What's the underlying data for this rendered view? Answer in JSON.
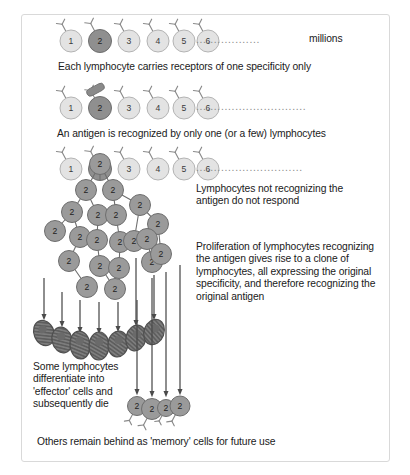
{
  "figure": {
    "background": "#ffffff",
    "frame_color": "#d9d9d9"
  },
  "colors": {
    "naive_cell_fill": "#e3e3e3",
    "naive_cell_stroke": "#b4b4b4",
    "selected_cell_fill": "#8f8f8f",
    "selected_cell_stroke": "#6e6e6e",
    "clone_cell_fill": "#9a9a9a",
    "clone_cell_stroke": "#6e6e6e",
    "effector_cell_fill": "#7d7d7d",
    "effector_cell_stroke": "#4f4f4f",
    "antigen_fill": "#8a8a8a",
    "arrow_color": "#4a4a4a",
    "receptor_color": "#8a8a8a",
    "text_color": "#1a1a1a",
    "dots_color": "#8a8a8a"
  },
  "rows": {
    "row1": {
      "name": "repertoire-row",
      "cell_labels": [
        "1",
        "2",
        "3",
        "4",
        "5",
        "6"
      ],
      "selected_index": 1,
      "dots": "..................",
      "trailing_label": "millions",
      "caption": "Each lymphocyte carries receptors of one specificity only"
    },
    "row2": {
      "name": "antigen-recognition-row",
      "cell_labels": [
        "1",
        "2",
        "3",
        "4",
        "5",
        "6"
      ],
      "selected_index": 1,
      "dots": "...............................",
      "antigen_name": "antigen",
      "caption": "An antigen is recognized by only one (or a few) lymphocytes"
    },
    "row3": {
      "name": "non-responding-row",
      "cell_labels": [
        "1",
        "2",
        "3",
        "4",
        "5",
        "6"
      ],
      "selected_index": 1,
      "dots": "..............................",
      "caption": "Lymphocytes not recognizing the\nantigen do not respond"
    }
  },
  "annotations": {
    "proliferation": "Proliferation of lymphocytes recognizing\nthe antigen gives rise to a clone of\nlymphocytes, all expressing the original\nspecificity, and therefore recognizing the\noriginal antigen",
    "effector": "Some lymphocytes\ndifferentiate into\n'effector' cells and\nsubsequently die",
    "memory": "Others remain behind as 'memory' cells for future use"
  },
  "clone": {
    "name": "proliferating-clone",
    "label": "2",
    "cells": [
      {
        "x": 100,
        "y": 164,
        "r": 10.5
      },
      {
        "x": 86,
        "y": 190,
        "r": 10.5
      },
      {
        "x": 113,
        "y": 190,
        "r": 10.5
      },
      {
        "x": 72,
        "y": 212,
        "r": 10.5
      },
      {
        "x": 98,
        "y": 215,
        "r": 10.5
      },
      {
        "x": 116,
        "y": 215,
        "r": 10.5
      },
      {
        "x": 140,
        "y": 205,
        "r": 10.5
      },
      {
        "x": 158,
        "y": 224,
        "r": 10.5
      },
      {
        "x": 55,
        "y": 231,
        "r": 10.5
      },
      {
        "x": 80,
        "y": 237,
        "r": 10.5
      },
      {
        "x": 97,
        "y": 240,
        "r": 10.5
      },
      {
        "x": 120,
        "y": 242,
        "r": 10.5
      },
      {
        "x": 134,
        "y": 241,
        "r": 10.5
      },
      {
        "x": 147,
        "y": 239,
        "r": 10.5
      },
      {
        "x": 69,
        "y": 261,
        "r": 10.5
      },
      {
        "x": 100,
        "y": 266,
        "r": 10.5
      },
      {
        "x": 119,
        "y": 268,
        "r": 10.5
      },
      {
        "x": 152,
        "y": 262,
        "r": 10.5
      },
      {
        "x": 161,
        "y": 254,
        "r": 10.5
      },
      {
        "x": 87,
        "y": 287,
        "r": 10.5
      },
      {
        "x": 115,
        "y": 289,
        "r": 10.5
      }
    ],
    "links": [
      [
        100,
        164,
        86,
        190
      ],
      [
        100,
        164,
        113,
        190
      ],
      [
        86,
        190,
        72,
        212
      ],
      [
        86,
        190,
        98,
        215
      ],
      [
        113,
        190,
        116,
        215
      ],
      [
        113,
        190,
        140,
        205
      ],
      [
        140,
        205,
        158,
        224
      ],
      [
        72,
        212,
        55,
        231
      ],
      [
        72,
        212,
        80,
        237
      ],
      [
        98,
        215,
        97,
        240
      ],
      [
        116,
        215,
        120,
        242
      ],
      [
        140,
        205,
        134,
        241
      ],
      [
        80,
        237,
        69,
        261
      ],
      [
        97,
        240,
        100,
        266
      ],
      [
        120,
        242,
        119,
        268
      ],
      [
        147,
        239,
        152,
        262
      ],
      [
        69,
        261,
        87,
        287
      ],
      [
        100,
        266,
        115,
        289
      ],
      [
        158,
        224,
        161,
        254
      ]
    ]
  },
  "effectors": {
    "name": "effector-cells",
    "cells": [
      {
        "x": 44,
        "y": 333,
        "rx": 10,
        "ry": 13,
        "rot": -22
      },
      {
        "x": 62,
        "y": 340,
        "rx": 10,
        "ry": 13,
        "rot": -14
      },
      {
        "x": 80,
        "y": 345,
        "rx": 10,
        "ry": 14,
        "rot": -6
      },
      {
        "x": 99,
        "y": 346,
        "rx": 10,
        "ry": 14,
        "rot": 2
      },
      {
        "x": 118,
        "y": 344,
        "rx": 10,
        "ry": 13,
        "rot": 8
      },
      {
        "x": 136,
        "y": 338,
        "rx": 10,
        "ry": 13,
        "rot": 14
      },
      {
        "x": 154,
        "y": 332,
        "rx": 10,
        "ry": 13,
        "rot": 20
      }
    ]
  },
  "memory": {
    "name": "memory-cells",
    "label": "2",
    "cells": [
      {
        "x": 137,
        "y": 406,
        "r": 9.5
      },
      {
        "x": 152,
        "y": 409,
        "r": 10.5
      },
      {
        "x": 166,
        "y": 408,
        "r": 8.5
      },
      {
        "x": 180,
        "y": 406,
        "r": 10.0
      }
    ]
  }
}
